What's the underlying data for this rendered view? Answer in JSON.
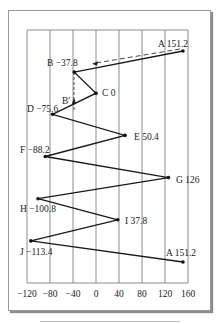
{
  "chart_data": {
    "type": "line",
    "title": "",
    "xlabel": "",
    "ylabel": "",
    "xlim": [
      -120,
      160
    ],
    "x_ticks": [
      "-120",
      "-80",
      "-40",
      "0",
      "40",
      "80",
      "120",
      "160"
    ],
    "x_tick_values": [
      -120,
      -80,
      -40,
      0,
      40,
      80,
      120,
      160
    ],
    "grid": "vertical",
    "points": [
      {
        "label": "A",
        "value": 151.2,
        "text": "A 151.2"
      },
      {
        "label": "B",
        "value": -37.8,
        "text": "B -37.8"
      },
      {
        "label": "C",
        "value": 0,
        "text": "C 0"
      },
      {
        "label": "D",
        "value": -75.6,
        "text": "D -75.6"
      },
      {
        "label": "E",
        "value": 50.4,
        "text": "E 50.4"
      },
      {
        "label": "F",
        "value": -88.2,
        "text": "F -88.2"
      },
      {
        "label": "G",
        "value": 126,
        "text": "G 126"
      },
      {
        "label": "H",
        "value": -100.8,
        "text": "H -100.8"
      },
      {
        "label": "I",
        "value": 37.8,
        "text": "I 37.8"
      },
      {
        "label": "J",
        "value": -113.4,
        "text": "J -113.4"
      },
      {
        "label": "A",
        "value": 151.2,
        "text": "A 151.2"
      }
    ],
    "annotations": [
      {
        "type": "dashed-arrow",
        "from": "A",
        "to": "B",
        "description": "dashed arrow from A toward B"
      },
      {
        "type": "dashed-arrow",
        "label": "B'",
        "description": "dashed vertical line below B with upward arrow labeled B'"
      }
    ]
  },
  "labels": {
    "b_prime": "B′"
  }
}
